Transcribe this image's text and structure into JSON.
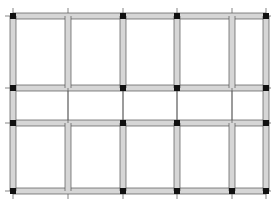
{
  "diagram": {
    "type": "structural-floor-framing-plan",
    "colors": {
      "background": "#ffffff",
      "beam_fill": "#d6d6d6",
      "beam_edge": "#555555",
      "axis_line": "#333333",
      "column_node": "#111111"
    },
    "grid": {
      "x_lines": [
        13,
        68,
        123,
        177,
        232,
        266
      ],
      "y_lines": [
        16,
        88,
        123,
        191
      ]
    },
    "beam_width": 6,
    "horizontal_beams": [
      {
        "y": 16,
        "x1": 13,
        "x2": 266
      },
      {
        "y": 88,
        "x1": 13,
        "x2": 266
      },
      {
        "y": 123,
        "x1": 13,
        "x2": 266
      },
      {
        "y": 191,
        "x1": 13,
        "x2": 266
      }
    ],
    "vertical_beams": [
      {
        "x": 13,
        "y1": 16,
        "y2": 191
      },
      {
        "x": 68,
        "y1": 16,
        "y2": 88
      },
      {
        "x": 68,
        "y1": 123,
        "y2": 191
      },
      {
        "x": 123,
        "y1": 16,
        "y2": 88
      },
      {
        "x": 123,
        "y1": 123,
        "y2": 191
      },
      {
        "x": 177,
        "y1": 16,
        "y2": 88
      },
      {
        "x": 177,
        "y1": 123,
        "y2": 191
      },
      {
        "x": 232,
        "y1": 16,
        "y2": 88
      },
      {
        "x": 232,
        "y1": 123,
        "y2": 191
      },
      {
        "x": 266,
        "y1": 16,
        "y2": 191
      }
    ],
    "thin_lines": [
      {
        "x": 68,
        "y1": 88,
        "y2": 123
      },
      {
        "x": 123,
        "y1": 88,
        "y2": 123
      },
      {
        "x": 177,
        "y1": 88,
        "y2": 123
      },
      {
        "x": 232,
        "y1": 88,
        "y2": 123
      }
    ],
    "column_nodes": [
      {
        "x": 13,
        "y": 16
      },
      {
        "x": 123,
        "y": 16
      },
      {
        "x": 177,
        "y": 16
      },
      {
        "x": 266,
        "y": 16
      },
      {
        "x": 13,
        "y": 88
      },
      {
        "x": 123,
        "y": 88
      },
      {
        "x": 177,
        "y": 88
      },
      {
        "x": 266,
        "y": 88
      },
      {
        "x": 13,
        "y": 123
      },
      {
        "x": 123,
        "y": 123
      },
      {
        "x": 177,
        "y": 123
      },
      {
        "x": 266,
        "y": 123
      },
      {
        "x": 13,
        "y": 191
      },
      {
        "x": 123,
        "y": 191
      },
      {
        "x": 177,
        "y": 191
      },
      {
        "x": 232,
        "y": 191
      },
      {
        "x": 266,
        "y": 191
      }
    ],
    "node_size": 6
  }
}
